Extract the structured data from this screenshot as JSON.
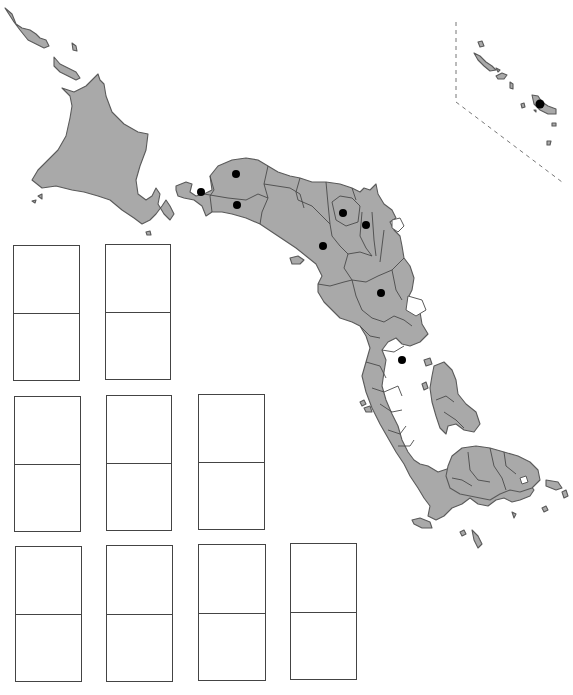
{
  "map": {
    "fill_color": "#a9a9a9",
    "border_color": "#5a5a5a",
    "dot_color": "#000000",
    "capital_markers": [
      {
        "x": 236,
        "y": 174
      },
      {
        "x": 201,
        "y": 192
      },
      {
        "x": 237,
        "y": 205
      },
      {
        "x": 343,
        "y": 213
      },
      {
        "x": 366,
        "y": 225
      },
      {
        "x": 323,
        "y": 246
      },
      {
        "x": 381,
        "y": 293
      },
      {
        "x": 402,
        "y": 360
      },
      {
        "x": 540,
        "y": 104
      }
    ],
    "inset": {
      "label": "",
      "style": "dashed"
    }
  },
  "answer_boxes": [
    {
      "id": 1,
      "row": 1,
      "top_value": "",
      "bottom_value": ""
    },
    {
      "id": 2,
      "row": 1,
      "top_value": "",
      "bottom_value": ""
    },
    {
      "id": 3,
      "row": 2,
      "top_value": "",
      "bottom_value": ""
    },
    {
      "id": 4,
      "row": 2,
      "top_value": "",
      "bottom_value": ""
    },
    {
      "id": 5,
      "row": 2,
      "top_value": "",
      "bottom_value": ""
    },
    {
      "id": 6,
      "row": 3,
      "top_value": "",
      "bottom_value": ""
    },
    {
      "id": 7,
      "row": 3,
      "top_value": "",
      "bottom_value": ""
    },
    {
      "id": 8,
      "row": 3,
      "top_value": "",
      "bottom_value": ""
    },
    {
      "id": 9,
      "row": 3,
      "top_value": "",
      "bottom_value": ""
    }
  ]
}
